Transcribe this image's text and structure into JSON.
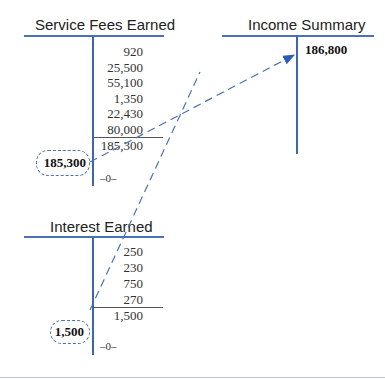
{
  "accounts": [
    {
      "name": "Service Fees Earned",
      "credits": [
        "920",
        "25,500",
        "55,100",
        "1,350",
        "22,430",
        "80,000"
      ],
      "credit_total": "185,300",
      "closing_debit": "185,300",
      "balance": "–0–"
    },
    {
      "name": "Income Summary",
      "credits": [
        "186,800"
      ]
    },
    {
      "name": "Interest Earned",
      "credits": [
        "250",
        "230",
        "750",
        "270"
      ],
      "credit_total": "1,500",
      "closing_debit": "1,500",
      "balance": "–0–"
    }
  ],
  "colors": {
    "line": "#3a66b8",
    "dashed": "#4a72b8"
  }
}
